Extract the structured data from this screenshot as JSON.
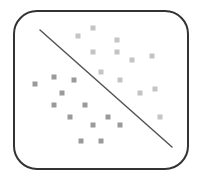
{
  "diagram": {
    "type": "linear-classifier-icon",
    "colors": {
      "border": "#333333",
      "line": "#555555",
      "class_a": "#9a9a9a",
      "class_b": "#c4c4c4"
    },
    "boundary_line": {
      "x1": 40,
      "y1": 30,
      "x2": 172,
      "y2": 147
    },
    "point_size": 5,
    "class_a_points": [
      [
        35,
        84
      ],
      [
        54,
        77
      ],
      [
        74,
        80
      ],
      [
        62,
        93
      ],
      [
        54,
        105
      ],
      [
        85,
        105
      ],
      [
        70,
        117
      ],
      [
        108,
        117
      ],
      [
        93,
        125
      ],
      [
        120,
        125
      ],
      [
        81,
        141
      ],
      [
        101,
        141
      ]
    ],
    "class_b_points": [
      [
        93,
        28
      ],
      [
        78,
        36
      ],
      [
        117,
        40
      ],
      [
        93,
        52
      ],
      [
        117,
        52
      ],
      [
        132,
        60
      ],
      [
        152,
        56
      ],
      [
        101,
        72
      ],
      [
        120,
        80
      ],
      [
        140,
        93
      ],
      [
        155,
        89
      ],
      [
        160,
        117
      ]
    ]
  }
}
